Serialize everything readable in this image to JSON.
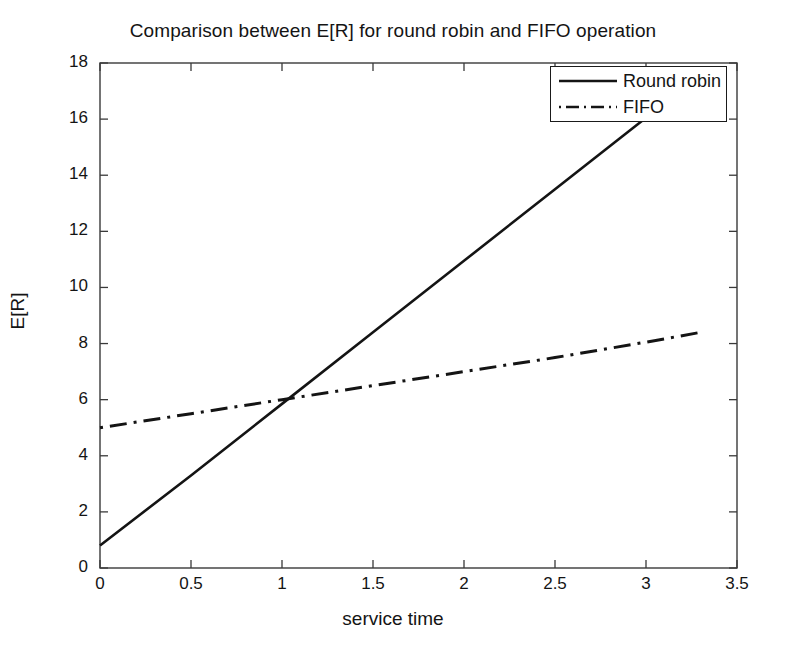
{
  "chart_data": {
    "type": "line",
    "title": "Comparison between E[R] for round robin and FIFO operation",
    "xlabel": "service time",
    "ylabel": "E[R]",
    "xlim": [
      0,
      3.5
    ],
    "ylim": [
      0,
      18
    ],
    "xticks": [
      "0",
      "0.5",
      "1",
      "1.5",
      "2",
      "2.5",
      "3",
      "3.5"
    ],
    "xtick_values": [
      0,
      0.5,
      1,
      1.5,
      2,
      2.5,
      3,
      3.5
    ],
    "yticks": [
      "0",
      "2",
      "4",
      "6",
      "8",
      "10",
      "12",
      "14",
      "16",
      "18"
    ],
    "ytick_values": [
      0,
      2,
      4,
      6,
      8,
      10,
      12,
      14,
      16,
      18
    ],
    "grid": false,
    "legend_position": "top-right",
    "series": [
      {
        "name": "Round robin",
        "style": "solid",
        "color": "#141414",
        "x": [
          0,
          0.5,
          1,
          1.5,
          2,
          2.5,
          3,
          3.3
        ],
        "values": [
          0.8,
          3.3,
          5.85,
          8.4,
          10.95,
          13.5,
          16.05,
          17.6
        ]
      },
      {
        "name": "FIFO",
        "style": "dash-dot",
        "color": "#141414",
        "x": [
          0,
          0.5,
          1,
          1.5,
          2,
          2.5,
          3,
          3.3
        ],
        "values": [
          5.0,
          5.5,
          6.0,
          6.5,
          7.0,
          7.5,
          8.05,
          8.4
        ]
      }
    ]
  },
  "legend": {
    "items": [
      {
        "label": "Round robin",
        "style": "solid"
      },
      {
        "label": "FIFO",
        "style": "dash-dot"
      }
    ]
  }
}
